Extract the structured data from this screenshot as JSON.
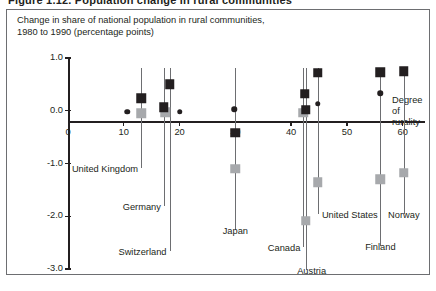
{
  "cropped_caption": "Figure 1.12.  Population change in rural communities",
  "figure": {
    "title": "Change in share of national population in rural communities,\n1980 to 1990 (percentage points)"
  },
  "chart_data": {
    "type": "scatter",
    "title": "Change in share of national population in rural communities, 1980 to 1990 (percentage points)",
    "xlabel": "Degree of rurality",
    "ylabel": "",
    "xlim": [
      0,
      64
    ],
    "ylim": [
      -3.0,
      1.0
    ],
    "grid": false,
    "legend_position": "none",
    "x_ticks": [
      0,
      10,
      20,
      30,
      40,
      50,
      60
    ],
    "x_tick_labels": [
      "0",
      "10",
      "20",
      "30",
      "40",
      "50",
      "60"
    ],
    "y_ticks": [
      1.0,
      0.0,
      -1.0,
      -2.0,
      -3.0
    ],
    "y_tick_labels": [
      "1.0",
      "0.0",
      "-1.0",
      "-2.0",
      "-3.0"
    ],
    "series": [
      {
        "name": "dark-square",
        "marker": "square",
        "color": "#231f20",
        "points": [
          {
            "country": "United Kingdom",
            "x": 13.1,
            "y": 0.24
          },
          {
            "country": "Germany",
            "x": 17.2,
            "y": 0.07
          },
          {
            "country": "Switzerland",
            "x": 18.2,
            "y": 0.5
          },
          {
            "country": "Japan",
            "x": 30.0,
            "y": -0.42
          },
          {
            "country": "Canada",
            "x": 42.4,
            "y": 0.32
          },
          {
            "country": "United States",
            "x": 42.6,
            "y": 0.02
          },
          {
            "country": "Austria",
            "x": 44.8,
            "y": 0.72
          },
          {
            "country": "Finland",
            "x": 56.0,
            "y": 0.73
          },
          {
            "country": "Norway",
            "x": 60.2,
            "y": 0.75
          }
        ]
      },
      {
        "name": "grey-square",
        "marker": "square",
        "color": "#a7a9ac",
        "points": [
          {
            "country": "United Kingdom",
            "x": 13.1,
            "y": -0.05
          },
          {
            "country": "Germany",
            "x": 17.4,
            "y": -0.03
          },
          {
            "country": "Japan",
            "x": 30.0,
            "y": -1.1
          },
          {
            "country": "Canada",
            "x": 42.2,
            "y": -0.04
          },
          {
            "country": "Austria",
            "x": 42.6,
            "y": -2.09
          },
          {
            "country": "United States",
            "x": 44.8,
            "y": -1.36
          },
          {
            "country": "Finland",
            "x": 56.0,
            "y": -1.3
          },
          {
            "country": "Norway",
            "x": 60.2,
            "y": -1.18
          }
        ]
      },
      {
        "name": "dark-dot",
        "marker": "circle",
        "color": "#231f20",
        "points": [
          {
            "country": "United Kingdom",
            "x": 10.6,
            "y": -0.02
          },
          {
            "country": "Switzerland",
            "x": 20.0,
            "y": -0.02
          },
          {
            "country": "Japan",
            "x": 29.8,
            "y": 0.03
          },
          {
            "country": "Austria",
            "x": 44.8,
            "y": 0.13
          },
          {
            "country": "Finland",
            "x": 56.0,
            "y": 0.33
          }
        ]
      }
    ],
    "annotations": [
      {
        "label": "United Kingdom",
        "x": 13.1
      },
      {
        "label": "Germany",
        "x": 17.2
      },
      {
        "label": "Switzerland",
        "x": 18.2
      },
      {
        "label": "Japan",
        "x": 30.0
      },
      {
        "label": "Canada",
        "x": 42.2
      },
      {
        "label": "Austria",
        "x": 42.6
      },
      {
        "label": "United States",
        "x": 44.8
      },
      {
        "label": "Finland",
        "x": 56.0
      },
      {
        "label": "Norway",
        "x": 60.2
      }
    ]
  },
  "labels": {
    "united_kingdom": "United Kingdom",
    "germany": "Germany",
    "switzerland": "Switzerland",
    "japan": "Japan",
    "canada": "Canada",
    "austria": "Austria",
    "united_states": "United States",
    "finland": "Finland",
    "norway": "Norway",
    "degree_of_rurality": "Degree\nof\nrurality"
  },
  "colors": {
    "dark_marker": "#231f20",
    "grey_marker": "#a7a9ac",
    "axis": "#231f20",
    "frame": "#6d6e71",
    "leader": "#6d6e71",
    "background": "#ffffff"
  }
}
